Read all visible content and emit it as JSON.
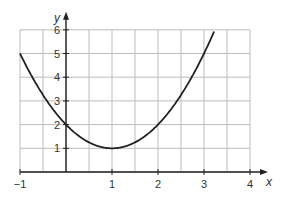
{
  "chart_data": {
    "type": "line",
    "title": "",
    "xlabel": "x",
    "ylabel": "y",
    "xlim": [
      -1,
      4
    ],
    "ylim": [
      0,
      6
    ],
    "grid": true,
    "grid_step_x": 0.5,
    "grid_step_y": 1,
    "x_ticks": [
      "-1",
      "1",
      "2",
      "3",
      "4"
    ],
    "y_ticks": [
      "1",
      "2",
      "3",
      "4",
      "5",
      "6"
    ],
    "series": [
      {
        "name": "y = (x - 1)^2 + 1",
        "x": [
          -1,
          -0.5,
          0,
          0.5,
          1,
          1.5,
          2,
          2.5,
          3,
          3.2
        ],
        "y": [
          5,
          3.25,
          2,
          1.25,
          1,
          1.25,
          2,
          3.25,
          5,
          5.84
        ]
      }
    ]
  }
}
